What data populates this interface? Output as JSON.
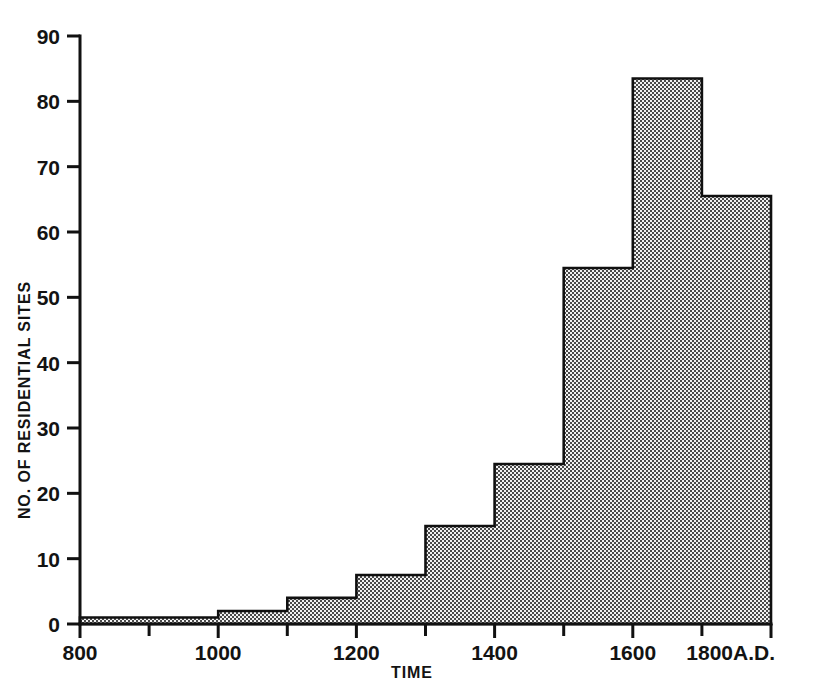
{
  "chart_data": {
    "type": "bar",
    "title": "",
    "subtitle": "",
    "xlabel": "TIME",
    "ylabel": "NO. OF RESIDENTIAL SITES",
    "xlim": [
      800,
      1800
    ],
    "ylim": [
      0,
      90
    ],
    "grid": false,
    "legend": null,
    "x_unit_suffix": "A.D.",
    "x_tick_labels": [
      "800",
      "1000",
      "1200",
      "1400",
      "1600",
      "1800A.D."
    ],
    "x_tick_values": [
      800,
      1000,
      1200,
      1400,
      1600,
      1800
    ],
    "x_minor_tick_values": [
      900,
      1100,
      1300,
      1500,
      1700
    ],
    "y_tick_labels": [
      "0",
      "10",
      "20",
      "30",
      "40",
      "50",
      "60",
      "70",
      "80",
      "90"
    ],
    "y_tick_values": [
      0,
      10,
      20,
      30,
      40,
      50,
      60,
      70,
      80,
      90
    ],
    "bin_edges": [
      800,
      900,
      1000,
      1100,
      1200,
      1300,
      1400,
      1500,
      1600,
      1700,
      1800
    ],
    "categories": [
      "800-900",
      "900-1000",
      "1000-1100",
      "1100-1200",
      "1200-1300",
      "1300-1400",
      "1400-1500",
      "1500-1600",
      "1600-1700",
      "1700-1800"
    ],
    "values": [
      1,
      1,
      2,
      4,
      7.5,
      15,
      24.5,
      54.5,
      83.5,
      65.5
    ],
    "bar_fill_color": "#a8a8a8",
    "bar_fill_pattern": "fine-checkerboard-dither",
    "bar_edge_color": "#101010",
    "axis_color": "#111111",
    "background_color": "#ffffff"
  },
  "figure": {
    "y_axis_label": "NO. OF RESIDENTIAL SITES",
    "x_axis_label": "TIME"
  }
}
